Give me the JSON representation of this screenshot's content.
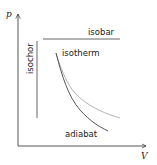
{
  "diagram": {
    "axes": {
      "x_label": "V",
      "y_label": "p"
    },
    "processes": [
      {
        "name": "isobar",
        "label": "isobar",
        "shape": "horizontal line",
        "color": "#555555"
      },
      {
        "name": "isochor",
        "label": "isochor",
        "shape": "vertical line",
        "color": "#555555"
      },
      {
        "name": "isotherm",
        "label": "isotherm",
        "shape": "hyperbola pV=const",
        "color": "#aaaaaa"
      },
      {
        "name": "adiabat",
        "label": "adiabat",
        "shape": "steeper curve pV^gamma=const",
        "color": "#444444"
      }
    ]
  }
}
